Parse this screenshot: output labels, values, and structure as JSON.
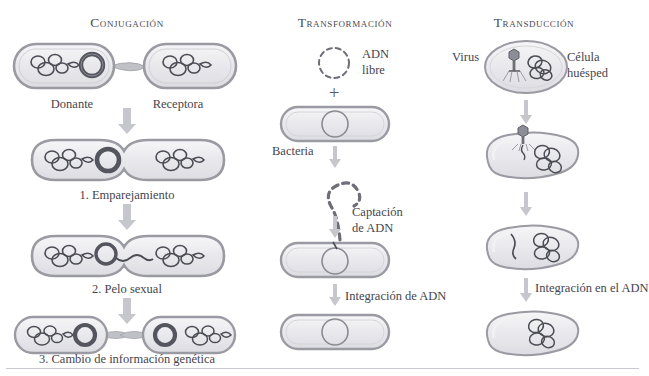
{
  "figure": {
    "kind": "biology-diagram",
    "palette": {
      "background": "#ffffff",
      "cell_fill": "#ededf0",
      "cell_stroke": "#9a9aa2",
      "dna_stroke": "#4c4c55",
      "plasmid_stroke": "#55555f",
      "arrow": "#b9b9c0",
      "text": "#45454d",
      "rule": "#c9c9cf"
    }
  },
  "columns": [
    {
      "id": "conjugacion",
      "title": "Conjugación",
      "title_x": 127,
      "title_y": 22,
      "labels": [
        {
          "id": "donante",
          "text": "Donante",
          "x": 72,
          "y": 92
        },
        {
          "id": "receptora",
          "text": "Receptora",
          "x": 178,
          "y": 92
        },
        {
          "id": "step1",
          "text": "1.  Emparejamiento",
          "x": 127,
          "y": 182
        },
        {
          "id": "step2",
          "text": "2.  Pelo sexual",
          "x": 127,
          "y": 276
        },
        {
          "id": "step3",
          "text": "3.  Cambio de información genética",
          "x": 127,
          "y": 359
        }
      ]
    },
    {
      "id": "transformacion",
      "title": "Transformación",
      "title_x": 345,
      "title_y": 22,
      "labels": [
        {
          "id": "adn-libre-1",
          "text": "ADN",
          "x": 383,
          "y": 54
        },
        {
          "id": "adn-libre-2",
          "text": "libre",
          "x": 383,
          "y": 70
        },
        {
          "id": "bacteria",
          "text": "Bacteria",
          "x": 300,
          "y": 150
        },
        {
          "id": "captacion-1",
          "text": "Captación",
          "x": 395,
          "y": 212
        },
        {
          "id": "captacion-2",
          "text": "de ADN",
          "x": 395,
          "y": 228
        },
        {
          "id": "integracion",
          "text": "Integración de ADN",
          "x": 403,
          "y": 296
        }
      ],
      "plus_sign": "+"
    },
    {
      "id": "transduccion",
      "title": "Transducción",
      "title_x": 534,
      "title_y": 22,
      "labels": [
        {
          "id": "virus",
          "text": "Virus",
          "x": 472,
          "y": 57
        },
        {
          "id": "huesped-1",
          "text": "Célula",
          "x": 590,
          "y": 57
        },
        {
          "id": "huesped-2",
          "text": "huésped",
          "x": 590,
          "y": 73
        },
        {
          "id": "integracion-adn",
          "text": "Integración en el ADN",
          "x": 578,
          "y": 288
        }
      ]
    }
  ]
}
